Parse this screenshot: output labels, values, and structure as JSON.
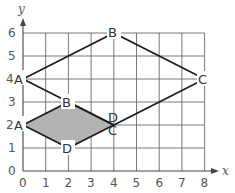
{
  "diagram": {
    "type": "coordinate-grid-geometry",
    "axes": {
      "x_label": "x",
      "y_label": "y",
      "x_range": [
        0,
        8
      ],
      "y_range": [
        0,
        6
      ],
      "x_ticks": [
        "0",
        "1",
        "2",
        "3",
        "4",
        "5",
        "6",
        "7",
        "8"
      ],
      "y_ticks": [
        "0",
        "1",
        "2",
        "3",
        "4",
        "5",
        "6"
      ],
      "grid": true
    },
    "shapes": [
      {
        "name": "small-quadrilateral",
        "filled": true,
        "fill_color": "#b3b3b3",
        "vertices": [
          {
            "label": "A",
            "x": 0,
            "y": 2
          },
          {
            "label": "B",
            "x": 2,
            "y": 3
          },
          {
            "label": "C",
            "x": 4,
            "y": 2
          },
          {
            "label": "D",
            "x": 2,
            "y": 1
          }
        ]
      },
      {
        "name": "large-quadrilateral",
        "filled": false,
        "vertices": [
          {
            "label": "A",
            "x": 0,
            "y": 4
          },
          {
            "label": "B",
            "x": 4,
            "y": 6
          },
          {
            "label": "C",
            "x": 8,
            "y": 4
          },
          {
            "label": "D",
            "x": 4,
            "y": 2
          }
        ]
      }
    ],
    "colors": {
      "grid": "#555555",
      "lines": "#1a1a1a",
      "fill": "#b3b3b3",
      "text": "#555555"
    }
  }
}
